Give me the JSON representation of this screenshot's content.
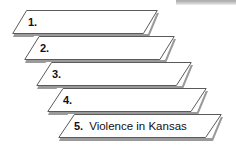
{
  "diagram": {
    "type": "sequence-steps-banner",
    "shape": "parallelogram",
    "step_count": 5,
    "accent_color": "#ffffff",
    "border_color": "#5a5a5a",
    "shadow_color": "#9a9a9a",
    "background_color": "#ffffff",
    "steps": [
      {
        "number": "1.",
        "text": "",
        "left": 12,
        "top": 10,
        "width": 146
      },
      {
        "number": "2.",
        "text": "",
        "left": 24,
        "top": 36,
        "width": 151
      },
      {
        "number": "3.",
        "text": "",
        "left": 36,
        "top": 62,
        "width": 156
      },
      {
        "number": "4.",
        "text": "",
        "left": 47,
        "top": 88,
        "width": 160
      },
      {
        "number": "5.",
        "text": "Violence in Kansas",
        "left": 58,
        "top": 114,
        "width": 164
      }
    ]
  },
  "decoration": {
    "top_strip_color": "#b9b9b9"
  }
}
